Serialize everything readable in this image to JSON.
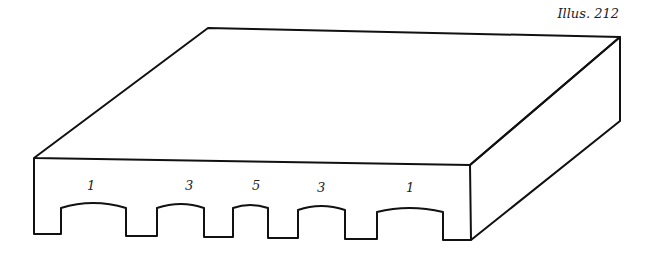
{
  "caption": "Illus. 212",
  "diagram": {
    "type": "isometric-block-with-arched-openings",
    "openings": [
      {
        "label": "1"
      },
      {
        "label": "3"
      },
      {
        "label": "5"
      },
      {
        "label": "3"
      },
      {
        "label": "1"
      }
    ]
  }
}
